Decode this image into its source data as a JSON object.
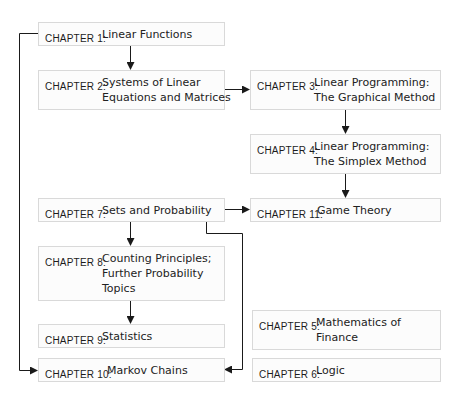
{
  "diagram": {
    "type": "chapter-dependency-flowchart",
    "nodes": [
      {
        "id": "ch1",
        "label": "CHAPTER 1:",
        "title_lines": [
          "Linear Functions"
        ]
      },
      {
        "id": "ch2",
        "label": "CHAPTER 2:",
        "title_lines": [
          "Systems of Linear",
          "Equations and Matrices"
        ]
      },
      {
        "id": "ch3",
        "label": "CHAPTER 3:",
        "title_lines": [
          "Linear Programming:",
          "The Graphical Method"
        ]
      },
      {
        "id": "ch4",
        "label": "CHAPTER 4:",
        "title_lines": [
          "Linear Programming:",
          "The Simplex Method"
        ]
      },
      {
        "id": "ch5",
        "label": "CHAPTER 5:",
        "title_lines": [
          "Mathematics of",
          "Finance"
        ]
      },
      {
        "id": "ch6",
        "label": "CHAPTER 6:",
        "title_lines": [
          "Logic"
        ]
      },
      {
        "id": "ch7",
        "label": "CHAPTER 7:",
        "title_lines": [
          "Sets and Probability"
        ]
      },
      {
        "id": "ch8",
        "label": "CHAPTER 8:",
        "title_lines": [
          "Counting Principles;",
          "Further Probability",
          "Topics"
        ]
      },
      {
        "id": "ch9",
        "label": "CHAPTER 9:",
        "title_lines": [
          "Statistics"
        ]
      },
      {
        "id": "ch10",
        "label": "CHAPTER 10:",
        "title_lines": [
          "Markov Chains"
        ]
      },
      {
        "id": "ch11",
        "label": "CHAPTER 11:",
        "title_lines": [
          "Game Theory"
        ]
      }
    ],
    "edges": [
      {
        "from": "ch1",
        "to": "ch2"
      },
      {
        "from": "ch1",
        "to": "ch10"
      },
      {
        "from": "ch2",
        "to": "ch3"
      },
      {
        "from": "ch3",
        "to": "ch4"
      },
      {
        "from": "ch4",
        "to": "ch11"
      },
      {
        "from": "ch7",
        "to": "ch11"
      },
      {
        "from": "ch7",
        "to": "ch8"
      },
      {
        "from": "ch7",
        "to": "ch10"
      },
      {
        "from": "ch8",
        "to": "ch9"
      }
    ],
    "colors": {
      "box_border": "#d9d9d9",
      "box_fill": "#fcfcfc",
      "line": "#1a1a1a"
    }
  }
}
